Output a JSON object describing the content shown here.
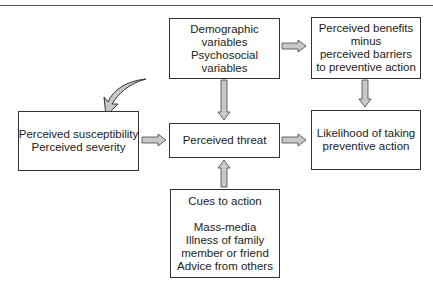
{
  "diagram": {
    "type": "flowchart",
    "boxes": {
      "demographic": {
        "lines": [
          "Demographic",
          "variables",
          "Psychosocial",
          "variables"
        ]
      },
      "benefits": {
        "lines": [
          "Perceived benefits",
          "minus",
          "perceived barriers",
          "to preventive action"
        ]
      },
      "susceptibility": {
        "lines": [
          "Perceived susceptibility",
          "Perceived severity"
        ]
      },
      "threat": {
        "lines": [
          "Perceived threat"
        ]
      },
      "likelihood": {
        "lines": [
          "Likelihood of taking",
          "preventive action"
        ]
      },
      "cues": {
        "heading": "Cues to action",
        "lines": [
          "Mass-media",
          "Illness of family",
          "member or friend",
          "Advice from others"
        ]
      }
    },
    "edges": [
      {
        "from": "demographic",
        "to": "benefits"
      },
      {
        "from": "demographic",
        "to": "threat"
      },
      {
        "from": "benefits",
        "to": "likelihood"
      },
      {
        "from": "susceptibility",
        "to": "threat"
      },
      {
        "from": "threat",
        "to": "likelihood"
      },
      {
        "from": "cues",
        "to": "threat"
      },
      {
        "from": "external",
        "to": "susceptibility",
        "style": "curved"
      }
    ],
    "colors": {
      "arrow_fill": "#c8c8c8",
      "arrow_stroke": "#444444",
      "border": "#333333"
    }
  }
}
